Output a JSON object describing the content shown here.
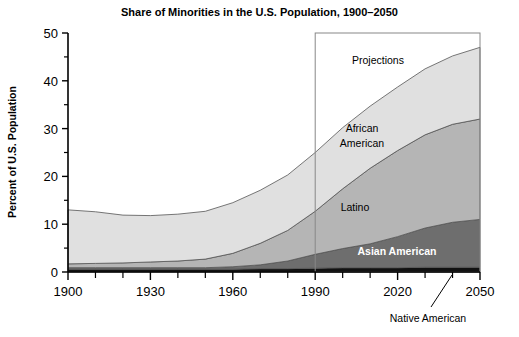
{
  "chart_data": {
    "type": "area",
    "title": "Share of Minorities in the U.S. Population, 1900–2050",
    "xlabel": "",
    "ylabel": "Percent of U.S. Population",
    "xlim": [
      1900,
      2050
    ],
    "ylim": [
      0,
      50
    ],
    "yticks": [
      0,
      10,
      20,
      30,
      40,
      50
    ],
    "ytick_labels": [
      "0",
      "10",
      "20",
      "30",
      "40",
      "50"
    ],
    "xticks": [
      1900,
      1930,
      1960,
      1990,
      2020,
      2050
    ],
    "xtick_labels": [
      "1900",
      "1930",
      "1960",
      "1990",
      "2020",
      "2050"
    ],
    "xminor_step": 10,
    "grid": false,
    "legend": "inline-labels",
    "stacked": true,
    "x": [
      1900,
      1910,
      1920,
      1930,
      1940,
      1950,
      1960,
      1970,
      1980,
      1990,
      2000,
      2010,
      2020,
      2030,
      2040,
      2050
    ],
    "series": [
      {
        "name": "Native American",
        "color": "#111111",
        "values": [
          0.6,
          0.6,
          0.6,
          0.6,
          0.6,
          0.6,
          0.6,
          0.7,
          0.7,
          0.8,
          0.9,
          0.9,
          0.9,
          1.0,
          1.0,
          1.0
        ]
      },
      {
        "name": "Asian American",
        "color": "#6e6e6e",
        "values": [
          0.3,
          0.3,
          0.3,
          0.3,
          0.3,
          0.3,
          0.5,
          0.8,
          1.6,
          2.9,
          4.0,
          5.0,
          6.5,
          8.2,
          9.4,
          10.0
        ]
      },
      {
        "name": "Latino",
        "color": "#b5b5b5",
        "values": [
          0.8,
          0.9,
          1.0,
          1.2,
          1.4,
          1.8,
          2.8,
          4.5,
          6.4,
          9.0,
          12.5,
          15.8,
          18.0,
          19.5,
          20.5,
          21.0
        ]
      },
      {
        "name": "African American",
        "color": "#e0e0e0",
        "values": [
          11.3,
          10.8,
          10.0,
          9.7,
          9.8,
          10.0,
          10.6,
          11.1,
          11.6,
          12.3,
          12.8,
          13.0,
          13.3,
          13.8,
          14.3,
          15.0
        ]
      }
    ],
    "totals": [
      13.0,
      12.6,
      11.9,
      11.8,
      12.1,
      12.7,
      14.5,
      17.1,
      20.3,
      25.0,
      30.2,
      34.7,
      38.7,
      42.5,
      45.2,
      47.0
    ],
    "annotations": [
      {
        "text": "Projections",
        "type": "box-label",
        "x_start": 1990,
        "x_end": 2050,
        "y_top": 50
      },
      {
        "text": "African American",
        "type": "series-label",
        "series": "African American"
      },
      {
        "text": "Latino",
        "type": "series-label",
        "series": "Latino"
      },
      {
        "text": "Asian American",
        "type": "series-label",
        "series": "Asian American"
      },
      {
        "text": "Native American",
        "type": "callout",
        "series": "Native American"
      }
    ]
  },
  "labels": {
    "title": "Share of Minorities in the U.S. Population, 1900–2050",
    "ylabel": "Percent of U.S. Population",
    "projections": "Projections",
    "african_american_line1": "African",
    "african_american_line2": "American",
    "latino": "Latino",
    "asian_american": "Asian American",
    "native_american": "Native American"
  }
}
